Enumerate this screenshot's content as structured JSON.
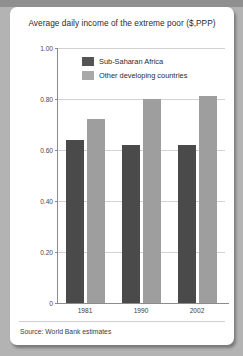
{
  "chart_data": {
    "type": "bar",
    "title": "Average daily income of the extreme poor ($,PPP)",
    "xlabel": "",
    "ylabel": "",
    "ylim": [
      0,
      1.0
    ],
    "grid": true,
    "legend_position": "top-center",
    "categories": [
      "1981",
      "1990",
      "2002"
    ],
    "ytick_labels": [
      "0",
      "0.20",
      "0.40",
      "0.60",
      "0.80",
      "1.00"
    ],
    "ytick_values": [
      0,
      0.2,
      0.4,
      0.6,
      0.8,
      1.0
    ],
    "series": [
      {
        "name": "Sub-Saharan Africa",
        "color": "#4a4a4a",
        "values": [
          0.64,
          0.62,
          0.62
        ]
      },
      {
        "name": "Other developing countries",
        "color": "#9e9e9e",
        "values": [
          0.72,
          0.8,
          0.81
        ]
      }
    ],
    "source": "Source: World Bank estimates"
  },
  "legend": {
    "items": [
      {
        "label": "Sub-Saharan Africa"
      },
      {
        "label": "Other developing countries"
      }
    ]
  }
}
